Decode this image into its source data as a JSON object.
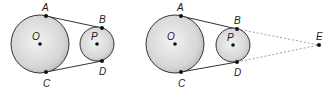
{
  "figures": [
    {
      "big_circle": {
        "cx": 40,
        "cy": 44,
        "r": 29,
        "center_label": "O"
      },
      "small_circle": {
        "cx": 97,
        "cy": 44,
        "r": 17,
        "center_label": "P"
      },
      "points": {
        "A": "A",
        "B": "B",
        "C": "C",
        "D": "D"
      }
    },
    {
      "big_circle": {
        "cx": 175,
        "cy": 44,
        "r": 29,
        "center_label": "O"
      },
      "small_circle": {
        "cx": 232,
        "cy": 45,
        "r": 17,
        "center_label": "P"
      },
      "points": {
        "A": "A",
        "B": "B",
        "C": "C",
        "D": "D",
        "E": "E"
      }
    }
  ],
  "colors": {
    "fill_outer": "#c8c8c8",
    "fill_inner": "#eeeeee",
    "stroke": "#333333",
    "dashed": "#999999"
  }
}
